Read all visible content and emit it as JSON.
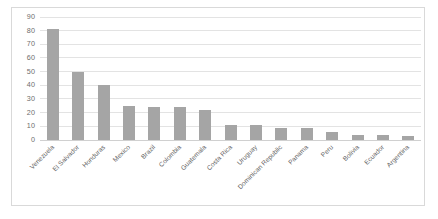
{
  "chart_data": {
    "type": "bar",
    "title": "",
    "xlabel": "",
    "ylabel": "",
    "ylim": [
      0,
      90
    ],
    "ytick_step": 10,
    "yticks": [
      90,
      80,
      70,
      60,
      50,
      40,
      30,
      20,
      10,
      0
    ],
    "grid": true,
    "legend": false,
    "bar_color": "#a5a5a5",
    "gridline_color": "#e3e3e3",
    "border_color": "#d9d9d9",
    "categories": [
      "Venezuela",
      "El Salvador",
      "Honduras",
      "Mexico",
      "Brazil",
      "Colombia",
      "Guatemala",
      "Costa Rica",
      "Uruguay",
      "Dominican Republic",
      "Panama",
      "Peru",
      "Bolivia",
      "Ecuador",
      "Argentina"
    ],
    "values": [
      81,
      50,
      40,
      25,
      24,
      24,
      22,
      11,
      11,
      9,
      8.5,
      6,
      4,
      3.5,
      3
    ]
  }
}
